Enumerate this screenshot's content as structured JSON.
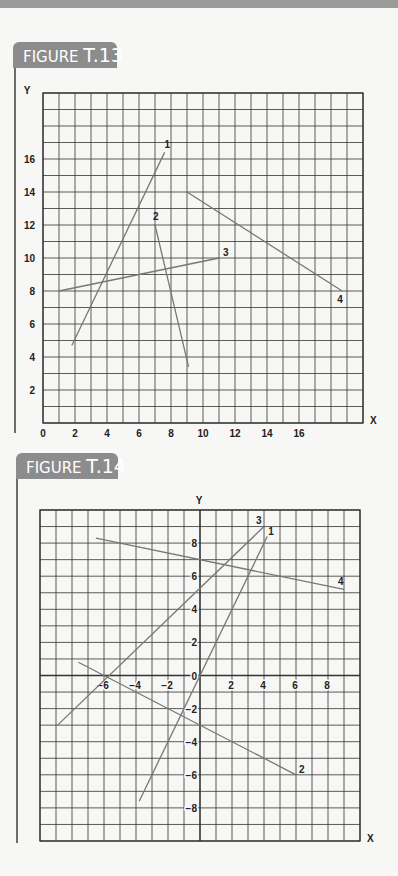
{
  "figures": [
    {
      "label_prefix": "FIGURE",
      "label_number": "T.13",
      "axis_x_label": "X",
      "axis_y_label": "Y"
    },
    {
      "label_prefix": "FIGURE",
      "label_number": "T.14",
      "axis_x_label": "X",
      "axis_y_label": "Y"
    }
  ],
  "colors": {
    "grid": "#333333",
    "lines": "#777777",
    "tab": "#8c8c8c",
    "band": "#9b9b9b"
  },
  "chart_data": [
    {
      "type": "line",
      "title": "FIGURE T.13",
      "xlabel": "X",
      "ylabel": "Y",
      "xlim": [
        0,
        20
      ],
      "ylim": [
        0,
        20
      ],
      "grid": true,
      "x_ticks": [
        "0",
        "2",
        "4",
        "6",
        "8",
        "10",
        "12",
        "14",
        "16"
      ],
      "y_ticks": [
        "2",
        "4",
        "6",
        "8",
        "10",
        "12",
        "14",
        "16"
      ],
      "series": [
        {
          "name": "1",
          "points": [
            [
              1.8,
              4.7
            ],
            [
              7.6,
              16.4
            ]
          ]
        },
        {
          "name": "2",
          "points": [
            [
              7.0,
              12.0
            ],
            [
              9.1,
              3.4
            ]
          ]
        },
        {
          "name": "3",
          "points": [
            [
              1.0,
              8.0
            ],
            [
              11.0,
              10.0
            ]
          ]
        },
        {
          "name": "4",
          "points": [
            [
              9.0,
              14.0
            ],
            [
              18.7,
              8.0
            ]
          ]
        }
      ]
    },
    {
      "type": "line",
      "title": "FIGURE T.14",
      "xlabel": "X",
      "ylabel": "Y",
      "xlim": [
        -10,
        10
      ],
      "ylim": [
        -10,
        10
      ],
      "grid": true,
      "x_ticks": [
        "-6",
        "-4",
        "-2",
        "2",
        "4",
        "6",
        "8"
      ],
      "y_ticks": [
        "8",
        "6",
        "4",
        "2",
        "0",
        "-2",
        "-4",
        "-6",
        "-8"
      ],
      "series": [
        {
          "name": "1",
          "points": [
            [
              -3.8,
              -7.6
            ],
            [
              4.2,
              8.4
            ]
          ]
        },
        {
          "name": "2",
          "points": [
            [
              -7.6,
              0.8
            ],
            [
              6.0,
              -6.0
            ]
          ]
        },
        {
          "name": "3",
          "points": [
            [
              -8.9,
              -3.0
            ],
            [
              4.0,
              9.0
            ]
          ]
        },
        {
          "name": "4",
          "points": [
            [
              -6.5,
              8.3
            ],
            [
              9.0,
              5.2
            ]
          ]
        }
      ]
    }
  ]
}
